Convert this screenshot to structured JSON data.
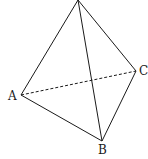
{
  "figure": {
    "type": "tetrahedron",
    "vertices": {
      "apex": {
        "x": 78,
        "y": 0,
        "label": ""
      },
      "A": {
        "x": 21,
        "y": 95,
        "label": "A"
      },
      "B": {
        "x": 102,
        "y": 141,
        "label": "B"
      },
      "C": {
        "x": 136,
        "y": 71,
        "label": "C"
      }
    },
    "labels": {
      "A": "A",
      "B": "B",
      "C": "C"
    },
    "edges": [
      {
        "from": "apex",
        "to": "A",
        "style": "solid"
      },
      {
        "from": "apex",
        "to": "B",
        "style": "solid"
      },
      {
        "from": "apex",
        "to": "C",
        "style": "solid"
      },
      {
        "from": "A",
        "to": "B",
        "style": "solid"
      },
      {
        "from": "B",
        "to": "C",
        "style": "solid"
      },
      {
        "from": "A",
        "to": "C",
        "style": "dashed"
      }
    ],
    "colors": {
      "line": "#1a1a1a",
      "background": "#ffffff"
    }
  }
}
